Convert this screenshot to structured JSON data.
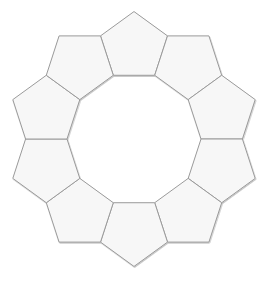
{
  "diagram": {
    "type": "pentagon-ring",
    "shape_count": 10,
    "center": [
      134,
      139
    ],
    "inner_decagon_radius": 67,
    "start_angle_deg": -90,
    "step_angle_deg": 36,
    "colors": {
      "background": "#ffffff",
      "fill": "#f7f7f7",
      "stroke": "#9a9a9a",
      "shadow": "#6e6e6e"
    },
    "stroke_width": 1,
    "pentagons": [
      {
        "id": 1,
        "label": ""
      },
      {
        "id": 2,
        "label": ""
      },
      {
        "id": 3,
        "label": ""
      },
      {
        "id": 4,
        "label": ""
      },
      {
        "id": 5,
        "label": ""
      },
      {
        "id": 6,
        "label": ""
      },
      {
        "id": 7,
        "label": ""
      },
      {
        "id": 8,
        "label": ""
      },
      {
        "id": 9,
        "label": ""
      },
      {
        "id": 10,
        "label": ""
      }
    ]
  }
}
